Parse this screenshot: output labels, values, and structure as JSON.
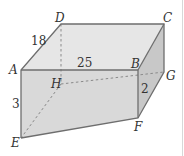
{
  "diagram": {
    "type": "rectangular box / prism",
    "colors": {
      "top_face": "#e6e6e6",
      "front_face": "#d9d9d9",
      "right_face": "#c8c8c8",
      "edge": "#6e6e6e",
      "hidden_edge": "#8a8a8a",
      "text": "#333333"
    },
    "vertices": {
      "A": {
        "label": "A",
        "x": 21,
        "y": 70
      },
      "B": {
        "label": "B",
        "x": 138,
        "y": 70
      },
      "C": {
        "label": "C",
        "x": 164,
        "y": 24
      },
      "D": {
        "label": "D",
        "x": 61,
        "y": 24
      },
      "E": {
        "label": "E",
        "x": 21,
        "y": 138
      },
      "F": {
        "label": "F",
        "x": 138,
        "y": 118
      },
      "G": {
        "label": "G",
        "x": 164,
        "y": 72
      },
      "H": {
        "label": "H",
        "x": 61,
        "y": 84
      }
    },
    "measurements": {
      "AD": "18",
      "AB": "25",
      "AE": "3",
      "BF": "2"
    },
    "hidden_edges": [
      "DH",
      "HE",
      "HG"
    ]
  }
}
